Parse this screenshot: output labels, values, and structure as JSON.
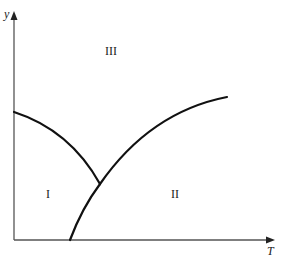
{
  "diagram": {
    "type": "phase-diagram",
    "axes": {
      "x_label": "T",
      "y_label": "y",
      "origin": [
        14,
        240
      ],
      "x_end": [
        272,
        240
      ],
      "y_end": [
        14,
        13
      ]
    },
    "regions": [
      {
        "id": "I",
        "label": "I",
        "position": [
          48,
          194
        ]
      },
      {
        "id": "II",
        "label": "II",
        "position": [
          175,
          194
        ]
      },
      {
        "id": "III",
        "label": "III",
        "position": [
          112,
          52
        ]
      }
    ],
    "curves": [
      {
        "name": "boundary-I-III",
        "description": "Curve from y-axis descending to triple point",
        "path": "M14 112 Q 70 130 100 184"
      },
      {
        "name": "boundary-I-II",
        "description": "Curve from T-axis rising to triple point",
        "path": "M70 240 Q 82 208 100 184"
      },
      {
        "name": "boundary-II-III",
        "description": "Curve from triple point rising to upper right",
        "path": "M100 184 Q 150 112 227 97"
      }
    ],
    "triple_point": [
      100,
      184
    ],
    "colors": {
      "axis": "#555555",
      "curve": "#111111",
      "text": "#222222",
      "background": "#ffffff"
    }
  }
}
